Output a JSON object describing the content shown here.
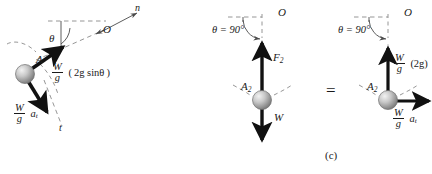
{
  "figure": {
    "caption": "(c)",
    "equals_sign": "=",
    "background_color": "#ffffff",
    "ink_color": "#1a1a1a",
    "ball_color": "#b5b5b5"
  },
  "diagram_left": {
    "name": "particle-on-curved-path",
    "point_label": "A",
    "center_label": "O",
    "normal_axis_label": "n",
    "tangent_axis_label": "t",
    "angle_label": "θ",
    "force_normal": {
      "numerator": "W",
      "denominator": "g",
      "expression": "( 2g sinθ )"
    },
    "force_tangent": {
      "numerator": "W",
      "denominator": "g",
      "expression": "a",
      "subscript": "t"
    }
  },
  "diagram_middle": {
    "name": "free-body-diagram",
    "angle_label": "θ = 90°",
    "center_label": "O",
    "point_label": "A",
    "point_subscript": "2",
    "force_up_label": "F",
    "force_up_subscript": "2",
    "force_down_label": "W"
  },
  "diagram_right": {
    "name": "kinetic-diagram",
    "angle_label": "θ = 90°",
    "center_label": "O",
    "point_label": "A",
    "point_subscript": "2",
    "force_up": {
      "numerator": "W",
      "denominator": "g",
      "expression": "(2g)"
    },
    "force_right": {
      "numerator": "W",
      "denominator": "g",
      "expression": "a",
      "subscript": "t"
    }
  }
}
